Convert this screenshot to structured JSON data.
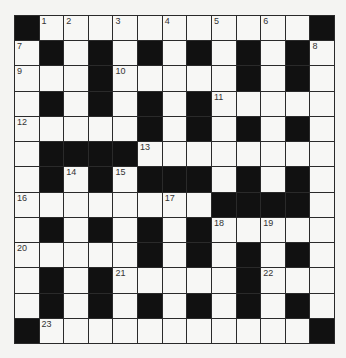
{
  "puzzle": {
    "rows": 13,
    "cols": 13,
    "colors": {
      "block": "#111111",
      "cell": "#f7f7f5",
      "line": "#2a2a2a"
    },
    "grid": [
      "#...........#",
      ".#.#.#.#.#.#.",
      "...#.....#.#.",
      ".#.#.#.#.....",
      ".....#.#.#.#.",
      ".####........",
      ".#.#.###.#.#.",
      "........####.",
      ".#.#.#.#.....",
      ".....#.#.#.#.",
      ".#.#.....#...",
      ".#.#.#.#.#.#.",
      "#...........#"
    ],
    "numbers": [
      {
        "r": 0,
        "c": 1,
        "n": "1"
      },
      {
        "r": 0,
        "c": 2,
        "n": "2"
      },
      {
        "r": 0,
        "c": 4,
        "n": "3"
      },
      {
        "r": 0,
        "c": 6,
        "n": "4"
      },
      {
        "r": 0,
        "c": 8,
        "n": "5"
      },
      {
        "r": 0,
        "c": 10,
        "n": "6"
      },
      {
        "r": 1,
        "c": 0,
        "n": "7"
      },
      {
        "r": 1,
        "c": 12,
        "n": "8"
      },
      {
        "r": 2,
        "c": 0,
        "n": "9"
      },
      {
        "r": 2,
        "c": 4,
        "n": "10"
      },
      {
        "r": 3,
        "c": 8,
        "n": "11"
      },
      {
        "r": 4,
        "c": 0,
        "n": "12"
      },
      {
        "r": 5,
        "c": 5,
        "n": "13"
      },
      {
        "r": 6,
        "c": 2,
        "n": "14"
      },
      {
        "r": 6,
        "c": 4,
        "n": "15"
      },
      {
        "r": 7,
        "c": 0,
        "n": "16"
      },
      {
        "r": 7,
        "c": 6,
        "n": "17"
      },
      {
        "r": 8,
        "c": 8,
        "n": "18"
      },
      {
        "r": 8,
        "c": 10,
        "n": "19"
      },
      {
        "r": 9,
        "c": 0,
        "n": "20"
      },
      {
        "r": 10,
        "c": 4,
        "n": "21"
      },
      {
        "r": 10,
        "c": 10,
        "n": "22"
      },
      {
        "r": 12,
        "c": 1,
        "n": "23"
      }
    ]
  }
}
